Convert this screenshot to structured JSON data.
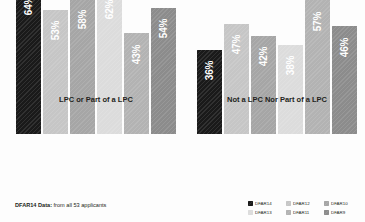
{
  "chart_data": {
    "type": "bar",
    "title": "",
    "subtitle": "",
    "xlabel": "",
    "ylabel": "",
    "ylim": [
      0,
      70
    ],
    "grid": false,
    "legend_position": "bottom-right",
    "categories": [
      "LPC or Part of a LPC",
      "Not a LPC Nor Part of a LPC"
    ],
    "series": [
      {
        "name": "DFAR14",
        "values": [
          64,
          36
        ],
        "color": "#1a1a1a"
      },
      {
        "name": "DFAR12",
        "values": [
          53,
          47
        ],
        "color": "#c6c6c6"
      },
      {
        "name": "DFAR10",
        "values": [
          58,
          42
        ],
        "color": "#a6a6a6"
      },
      {
        "name": "DFAR13",
        "values": [
          62,
          38
        ],
        "color": "#dcdcdc"
      },
      {
        "name": "DFAR11",
        "values": [
          43,
          57
        ],
        "color": "#b3b3b3"
      },
      {
        "name": "DFAR9",
        "values": [
          54,
          46
        ],
        "color": "#8c8c8c"
      }
    ],
    "value_labels": [
      [
        "64%",
        "53%",
        "58%",
        "62%",
        "43%",
        "54%"
      ],
      [
        "36%",
        "47%",
        "42%",
        "38%",
        "57%",
        "46%"
      ]
    ]
  },
  "groups": [
    {
      "label": "LPC or Part of a LPC",
      "bars": [
        {
          "series": "DFAR14",
          "label": "64%",
          "value": 64,
          "color": "#1a1a1a"
        },
        {
          "series": "DFAR12",
          "label": "53%",
          "value": 53,
          "color": "#c6c6c6"
        },
        {
          "series": "DFAR10",
          "label": "58%",
          "value": 58,
          "color": "#a6a6a6"
        },
        {
          "series": "DFAR13",
          "label": "62%",
          "value": 62,
          "color": "#dcdcdc"
        },
        {
          "series": "DFAR11",
          "label": "43%",
          "value": 43,
          "color": "#b3b3b3"
        },
        {
          "series": "DFAR9",
          "label": "54%",
          "value": 54,
          "color": "#8c8c8c"
        }
      ]
    },
    {
      "label": "Not a LPC Nor Part of a LPC",
      "bars": [
        {
          "series": "DFAR14",
          "label": "36%",
          "value": 36,
          "color": "#1a1a1a"
        },
        {
          "series": "DFAR12",
          "label": "47%",
          "value": 47,
          "color": "#c6c6c6"
        },
        {
          "series": "DFAR10",
          "label": "42%",
          "value": 42,
          "color": "#a6a6a6"
        },
        {
          "series": "DFAR13",
          "label": "38%",
          "value": 38,
          "color": "#dcdcdc"
        },
        {
          "series": "DFAR11",
          "label": "57%",
          "value": 57,
          "color": "#b3b3b3"
        },
        {
          "series": "DFAR9",
          "label": "46%",
          "value": 46,
          "color": "#8c8c8c"
        }
      ]
    }
  ],
  "footnote": {
    "strong": "DFAR14 Data:",
    "rest": " from all 53 applicants"
  },
  "legend": {
    "items": [
      {
        "label": "DFAR14",
        "color": "#1a1a1a"
      },
      {
        "label": "DFAR12",
        "color": "#c6c6c6"
      },
      {
        "label": "DFAR10",
        "color": "#a6a6a6"
      },
      {
        "label": "DFAR13",
        "color": "#dcdcdc"
      },
      {
        "label": "DFAR11",
        "color": "#b3b3b3"
      },
      {
        "label": "DFAR9",
        "color": "#8c8c8c"
      }
    ]
  },
  "theme": {
    "background": "#fdfdfd",
    "text": "#231f20"
  }
}
